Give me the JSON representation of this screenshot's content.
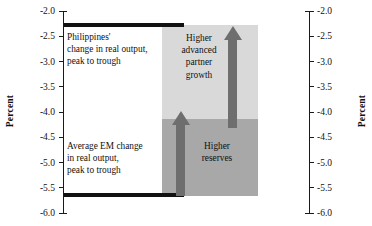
{
  "chart_data": {
    "type": "bar",
    "title": "",
    "subtitle": "",
    "xlabel": "",
    "ylabel": "Percent",
    "ylabel_right": "Percent",
    "ylim": [
      -6.0,
      -2.0
    ],
    "y_ticks": [
      "-2.0",
      "-2.5",
      "-3.0",
      "-3.5",
      "-4.0",
      "-4.5",
      "-5.0",
      "-5.5",
      "-6.0"
    ],
    "y_tick_values": [
      -2.0,
      -2.5,
      -3.0,
      -3.5,
      -4.0,
      -4.5,
      -5.0,
      -5.5,
      -6.0
    ],
    "grid": false,
    "legend": "none",
    "series": [
      {
        "name": "Philippines' change in real output, peak to trough",
        "value": -2.3,
        "style": "black-horizontal-bar"
      },
      {
        "name": "Average EM change in real output, peak to trough",
        "value": -5.65,
        "style": "black-horizontal-bar"
      }
    ],
    "stacked_block": {
      "top": -2.3,
      "bottom": -5.65,
      "segments": [
        {
          "label": "Higher advanced partner growth",
          "from": -2.3,
          "to": -4.05,
          "color": "#d9d9d9"
        },
        {
          "label": "Higher reserves",
          "from": -4.05,
          "to": -5.65,
          "color": "#a8a8a8"
        }
      ]
    },
    "annotations": [
      {
        "text": "Higher advanced partner growth",
        "arrow": "up"
      },
      {
        "text": "Higher reserves",
        "arrow": "up"
      }
    ]
  },
  "axes": {
    "left": {
      "title": "Percent",
      "ticks": [
        "-2.0",
        "-2.5",
        "-3.0",
        "-3.5",
        "-4.0",
        "-4.5",
        "-5.0",
        "-5.5",
        "-6.0"
      ]
    },
    "right": {
      "title": "Percent",
      "ticks": [
        "-2.0",
        "-2.5",
        "-3.0",
        "-3.5",
        "-4.0",
        "-4.5",
        "-5.0",
        "-5.5",
        "-6.0"
      ]
    }
  },
  "callouts": {
    "philippines": "Philippines'\nchange in real output,\npeak to trough",
    "emerging_markets": "Average EM change\nin real output,\npeak to trough"
  },
  "block_labels": {
    "growth": "Higher\nadvanced\npartner\ngrowth",
    "reserves": "Higher\nreserves"
  },
  "colors": {
    "bar": "#111111",
    "block_upper": "#d9d9d9",
    "block_lower": "#a8a8a8",
    "arrow": "#6e6e6e",
    "axis": "#1a1a1a",
    "background": "#ffffff"
  }
}
